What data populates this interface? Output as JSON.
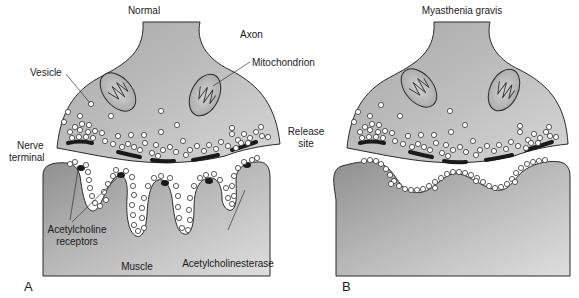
{
  "panels": [
    {
      "id": "A",
      "title": "Normal",
      "letter": "A",
      "labels": {
        "axon": "Axon",
        "mitochondrion": "Mitochondrion",
        "vesicle": "Vesicle",
        "nerve_terminal_line1": "Nerve",
        "nerve_terminal_line2": "terminal",
        "release_site_line1": "Release",
        "release_site_line2": "site",
        "ach_receptors_line1": "Acetylcholine",
        "ach_receptors_line2": "receptors",
        "muscle": "Muscle",
        "acetylcholinesterase": "Acetylcholinesterase"
      }
    },
    {
      "id": "B",
      "title": "Myasthenia gravis",
      "letter": "B"
    }
  ],
  "colors": {
    "tissue_fill": "#b4b4b4",
    "tissue_fill_dark": "#8f8f8f",
    "outline": "#2a2a2a",
    "release_site": "#1a1a1a",
    "background": "#ffffff"
  }
}
